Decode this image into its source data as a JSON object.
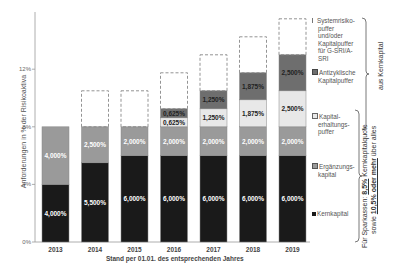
{
  "chart_data": {
    "type": "bar",
    "stacked": true,
    "title": "",
    "xlabel": "Stand per 01.01. des entsprechenden Jahres",
    "ylabel": "Anforderungen in % der Risikoaktiva",
    "ylim": [
      0,
      12
    ],
    "yticks": [
      "0%",
      "4%",
      "8%",
      "12%"
    ],
    "categories": [
      "2013",
      "2014",
      "2015",
      "2016",
      "2017",
      "2018",
      "2019"
    ],
    "series": [
      {
        "name": "Kernkapital",
        "color": "#1a1a1a",
        "values": [
          4.0,
          5.5,
          6.0,
          6.0,
          6.0,
          6.0,
          6.0
        ],
        "labels": [
          "4,000%",
          "5,500%",
          "6,000%",
          "6,000%",
          "6,000%",
          "6,000%",
          "6,000%"
        ]
      },
      {
        "name": "Ergänzungskapital",
        "color": "#9a9a9a",
        "values": [
          4.0,
          2.5,
          2.0,
          2.0,
          2.0,
          2.0,
          2.0
        ],
        "labels": [
          "4,000%",
          "2,500%",
          "2,000%",
          "2,000%",
          "2,000%",
          "2,000%",
          "2,000%"
        ]
      },
      {
        "name": "Kapitalerhaltungspuffer",
        "color": "#e8e8e8",
        "values": [
          0,
          0,
          0,
          0.625,
          1.25,
          1.875,
          2.5
        ],
        "labels": [
          "",
          "",
          "",
          "0,625%",
          "1,250%",
          "1,875%",
          "2,500%"
        ]
      },
      {
        "name": "Antizyklische Kapitalpuffer",
        "color": "#6e6e6e",
        "values": [
          0,
          0,
          0,
          0.625,
          1.25,
          1.875,
          2.5
        ],
        "labels": [
          "",
          "",
          "",
          "0,625%",
          "1,250%",
          "1,875%",
          "2,500%"
        ]
      },
      {
        "name": "Systemrisikopuffer und/oder Kapitalpuffer für G-SRI/A-SRI",
        "color": "none",
        "dashed": true,
        "values": [
          0,
          2.5,
          2.5,
          2.5,
          2.5,
          2.5,
          2.5
        ],
        "labels": [
          "",
          "",
          "",
          "",
          "",
          "",
          ""
        ]
      }
    ],
    "legend": [
      "Systemrisikopuffer und/oder Kapitalpuffer für G-SRI/A-SRI",
      "Antizyklische Kapitalpuffer",
      "Kapitalerhaltungspuffer",
      "Ergänzungskapital",
      "Kernkapital"
    ],
    "legend_position": "right",
    "annotations": [
      "aus Kernkapital",
      "Für Sparkassen: 8,5% Kernkapitalquote sowie 10,5% oder mehr über alles"
    ],
    "grid": false
  },
  "legend_text": {
    "systemic": [
      "Systemrisiko-",
      "puffer",
      "und/oder",
      "Kapitalpuffer",
      "für G-SRI/A-",
      "SRI"
    ],
    "countercyclical": [
      "Antizyklische",
      "Kapitalpuffer"
    ],
    "conservation": [
      "Kapital-",
      "erhaltungs-",
      "puffer"
    ],
    "tier2": [
      "Ergänzungs-",
      "kapital"
    ],
    "tier1": [
      "Kernkapital"
    ]
  },
  "brace_labels": {
    "core": "aus Kernkapital",
    "sparkassen_line1_pre": "Für Sparkassen: ",
    "sparkassen_line1_val": "8,5%",
    "sparkassen_line1_post": " Kernkapitalquote",
    "sparkassen_line2_pre": "sowie ",
    "sparkassen_line2_val": "10,5% oder mehr",
    "sparkassen_line2_post": " über alles"
  }
}
